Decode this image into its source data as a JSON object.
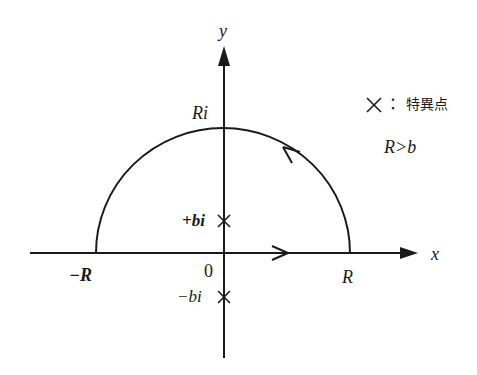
{
  "diagram": {
    "type": "complex-plane-contour",
    "axes": {
      "x_label": "x",
      "y_label": "y",
      "origin_label": "0"
    },
    "contour": {
      "shape": "upper semicircle closed by real-axis segment",
      "direction": "counterclockwise",
      "top_label": "Ri",
      "left_label": "−R",
      "right_label": "R"
    },
    "singularities": [
      {
        "label": "+bi",
        "position": "upper imaginary axis"
      },
      {
        "label": "−bi",
        "position": "lower imaginary axis"
      }
    ],
    "legend": {
      "marker": "×",
      "separator": "：",
      "meaning": "特異点",
      "condition": "R>b"
    },
    "colors": {
      "stroke": "#1a1a1a",
      "background": "#ffffff"
    }
  }
}
